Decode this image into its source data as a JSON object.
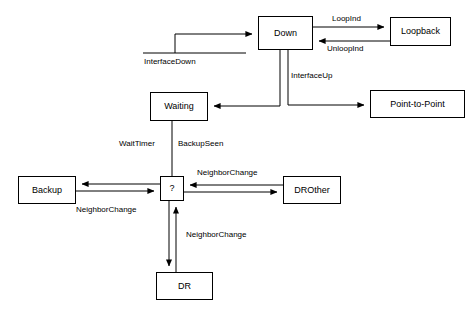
{
  "diagram": {
    "stroke_color": "#000000",
    "background_color": "#ffffff",
    "nodes": [
      {
        "id": "down",
        "label": "Down",
        "x": 258,
        "y": 16,
        "w": 55,
        "h": 34
      },
      {
        "id": "loopback",
        "label": "Loopback",
        "x": 390,
        "y": 17,
        "w": 61,
        "h": 29
      },
      {
        "id": "point_to_point",
        "label": "Point-to-Point",
        "x": 370,
        "y": 90,
        "w": 95,
        "h": 28
      },
      {
        "id": "waiting",
        "label": "Waiting",
        "x": 150,
        "y": 92,
        "w": 58,
        "h": 29
      },
      {
        "id": "backup",
        "label": "Backup",
        "x": 18,
        "y": 176,
        "w": 58,
        "h": 28
      },
      {
        "id": "question",
        "label": "?",
        "x": 160,
        "y": 176,
        "w": 24,
        "h": 25
      },
      {
        "id": "drother",
        "label": "DROther",
        "x": 283,
        "y": 176,
        "w": 58,
        "h": 28
      },
      {
        "id": "dr",
        "label": "DR",
        "x": 156,
        "y": 272,
        "w": 57,
        "h": 28
      }
    ],
    "edge_labels": [
      {
        "id": "interface_down",
        "label": "InterfaceDown",
        "x": 144,
        "y": 58
      },
      {
        "id": "loopind",
        "label": "LoopInd",
        "x": 332,
        "y": 15
      },
      {
        "id": "unloopind",
        "label": "UnloopInd",
        "x": 327,
        "y": 45
      },
      {
        "id": "interface_up",
        "label": "InterfaceUp",
        "x": 291,
        "y": 72
      },
      {
        "id": "wait_timer",
        "label": "WaitTimer",
        "x": 119,
        "y": 140
      },
      {
        "id": "backup_seen",
        "label": "BackupSeen",
        "x": 178,
        "y": 140
      },
      {
        "id": "nc_backup",
        "label": "NeighborChange",
        "x": 76,
        "y": 206
      },
      {
        "id": "nc_drother",
        "label": "NeighborChange",
        "x": 197,
        "y": 169
      },
      {
        "id": "nc_dr",
        "label": "NeighborChange",
        "x": 186,
        "y": 231
      }
    ]
  }
}
